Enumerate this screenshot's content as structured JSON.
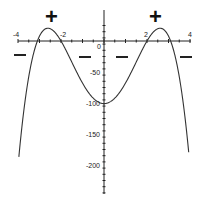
{
  "chart_data": {
    "type": "line",
    "title": "",
    "xlabel": "",
    "ylabel": "",
    "xlim": [
      -4,
      4
    ],
    "ylim": [
      -250,
      20
    ],
    "grid": false,
    "x_ticks": [
      -4,
      -2,
      0,
      2,
      4
    ],
    "x_tick_labels": [
      "-4",
      "-2",
      "0",
      "2",
      "4"
    ],
    "y_ticks": [
      -50,
      -100,
      -150,
      -200
    ],
    "y_tick_labels": [
      "-50",
      "-100",
      "-150",
      "-200"
    ],
    "series": [
      {
        "name": "f(x)",
        "x": [
          -3.95,
          -3.5,
          -3.1,
          -2.8,
          -2.55,
          -2.3,
          -2.0,
          -1.5,
          -1.0,
          -0.5,
          0,
          0.5,
          1.0,
          1.5,
          2.0,
          2.3,
          2.55,
          2.8,
          3.1,
          3.5,
          3.95
        ],
        "y": [
          -250,
          -110,
          0,
          14,
          16,
          12,
          0,
          -40,
          -76,
          -95,
          -101,
          -95,
          -76,
          -40,
          0,
          12,
          16,
          14,
          0,
          -110,
          -250
        ]
      }
    ],
    "annotations": {
      "plus_signs": [
        {
          "x": -2.55,
          "label": "+"
        },
        {
          "x": 2.55,
          "label": "+"
        }
      ],
      "minus_signs": [
        {
          "region": "x < -3.1",
          "label": "−"
        },
        {
          "region": "-2 < x < 0",
          "label": "−"
        },
        {
          "region": "0 < x < 2",
          "label": "−"
        },
        {
          "region": "x > 3.1",
          "label": "−"
        }
      ]
    }
  },
  "labels": {
    "plus": "+",
    "x_neg4": "-4",
    "x_neg2": "-2",
    "x_zero": "0",
    "x_pos2": "2",
    "x_pos4": "4",
    "y_neg50": "-50",
    "y_neg100": "-100",
    "y_neg150": "-150",
    "y_neg200": "-200"
  },
  "colors": {
    "axis": "#222222",
    "curve": "#333333",
    "background": "#ffffff"
  }
}
